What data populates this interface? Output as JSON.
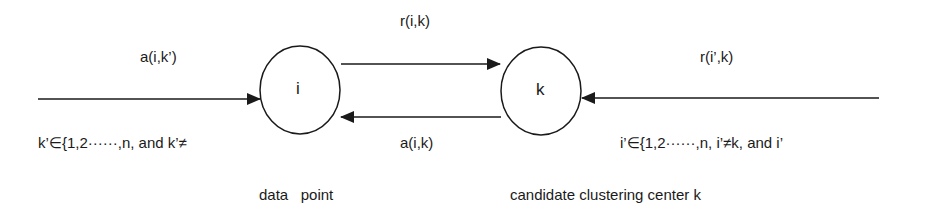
{
  "diagram": {
    "nodes": [
      {
        "id": "i",
        "label": "i",
        "caption": "data   point"
      },
      {
        "id": "k",
        "label": "k",
        "caption": "candidate clustering center k"
      }
    ],
    "edges": [
      {
        "id": "incoming-to-i",
        "label": "a(i,k’)",
        "sublabel": "k’∈{1,2······,n,  and  k’≠"
      },
      {
        "id": "i-to-k",
        "label": "r(i,k)"
      },
      {
        "id": "k-to-i",
        "label": "a(i,k)"
      },
      {
        "id": "incoming-to-k",
        "label": "r(i’,k)",
        "sublabel": "i’∈{1,2······,n,  i’≠k,  and  i’"
      }
    ]
  },
  "colors": {
    "stroke": "#1a1a1a",
    "background": "#ffffff"
  }
}
